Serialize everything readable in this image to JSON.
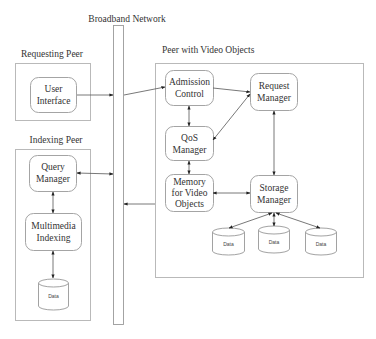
{
  "diagram": {
    "network": {
      "label": "Broadband Network"
    },
    "groups": [
      {
        "id": "requesting",
        "label": "Requesting Peer"
      },
      {
        "id": "indexing",
        "label": "Indexing Peer"
      },
      {
        "id": "video",
        "label": "Peer with Video Objects"
      }
    ],
    "nodes": {
      "user_interface": {
        "line1": "User",
        "line2": "Interface"
      },
      "query_manager": {
        "line1": "Query",
        "line2": "Manager"
      },
      "multimedia_indexing": {
        "line1": "Multimedia",
        "line2": "Indexing"
      },
      "index_data": {
        "label": "Data"
      },
      "admission_control": {
        "line1": "Admission",
        "line2": "Control"
      },
      "qos_manager": {
        "line1": "QoS",
        "line2": "Manager"
      },
      "memory": {
        "line1": "Memory",
        "line2": "for Video",
        "line3": "Objects"
      },
      "request_manager": {
        "line1": "Request",
        "line2": "Manager"
      },
      "storage_manager": {
        "line1": "Storage",
        "line2": "Manager"
      },
      "data1": {
        "label": "Data"
      },
      "data2": {
        "label": "Data"
      },
      "data3": {
        "label": "Data"
      }
    },
    "edges": [
      {
        "from": "User Interface",
        "to": "Broadband Network",
        "type": "directed"
      },
      {
        "from": "Broadband Network",
        "to": "Admission Control",
        "type": "directed"
      },
      {
        "from": "Query Manager",
        "to": "Broadband Network",
        "type": "bidirectional"
      },
      {
        "from": "Peer with Video Objects",
        "to": "Broadband Network",
        "type": "directed"
      },
      {
        "from": "Query Manager",
        "to": "Multimedia Indexing",
        "type": "bidirectional"
      },
      {
        "from": "Multimedia Indexing",
        "to": "Data",
        "type": "bidirectional"
      },
      {
        "from": "Admission Control",
        "to": "Request Manager",
        "type": "directed"
      },
      {
        "from": "Admission Control",
        "to": "QoS Manager",
        "type": "bidirectional"
      },
      {
        "from": "QoS Manager",
        "to": "Request Manager",
        "type": "bidirectional"
      },
      {
        "from": "QoS Manager",
        "to": "Memory for Video Objects",
        "type": "bidirectional"
      },
      {
        "from": "Memory for Video Objects",
        "to": "Storage Manager",
        "type": "bidirectional"
      },
      {
        "from": "Request Manager",
        "to": "Storage Manager",
        "type": "bidirectional"
      },
      {
        "from": "Storage Manager",
        "to": "Data",
        "type": "bidirectional",
        "count": 3
      }
    ],
    "colors": {
      "line": "#555555",
      "frame": "#b9b9b9",
      "node_border": "#9a9a9a",
      "text": "#333333"
    }
  }
}
